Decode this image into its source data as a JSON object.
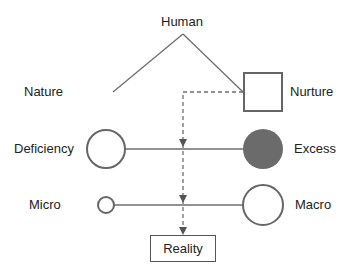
{
  "diagram": {
    "top": {
      "label": "Human"
    },
    "branches": {
      "left": "Nature",
      "right": "Nurture"
    },
    "rows": [
      {
        "left": "Deficiency",
        "right": "Excess"
      },
      {
        "left": "Micro",
        "right": "Macro"
      }
    ],
    "result": {
      "label": "Reality"
    },
    "colors": {
      "line": "#6e6e6e",
      "filled_circle": "#6b6b6b",
      "box_border": "#555555"
    }
  }
}
